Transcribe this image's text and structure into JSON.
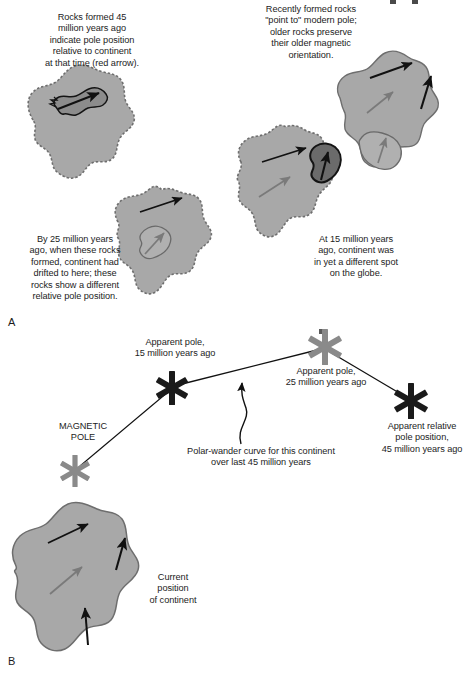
{
  "figure": {
    "background_color": "#ffffff",
    "continent_fill": "#a8a8a8",
    "continent_stroke": "#6e6e6e",
    "dark_rock_fill": "#6b6b6b",
    "dark_rock_stroke": "#141414",
    "light_rock_fill": "#b0b0b0",
    "light_rock_stroke": "#6a6a6a",
    "black_arrow_color": "#111111",
    "gray_arrow_color": "#7a7a7a",
    "star_black": "#1a1a1a",
    "star_gray": "#8a8a8a",
    "line_color": "#111111"
  },
  "panel_a": {
    "letter": "A",
    "captions": [
      {
        "name": "caption-45ma",
        "text": "Rocks formed 45\nmillion years ago\nindicate pole position\nrelative to continent\nat that time (red arrow).",
        "x": 12,
        "y": 12,
        "width": 160
      },
      {
        "name": "caption-recent-rocks",
        "text": "Recently formed rocks\n\"point to\" modern pole;\nolder rocks preserve\ntheir older magnetic\norientation.",
        "x": 236,
        "y": 4,
        "width": 150
      },
      {
        "name": "caption-25ma",
        "text": "By 25 million years\nago, when these rocks\nformed, continent had\ndrifted to here; these\nrocks show a different\nrelative pole position.",
        "x": 8,
        "y": 234,
        "width": 134
      },
      {
        "name": "caption-15ma",
        "text": "At 15 million years\nago, continent was\nin yet a different spot\non the globe.",
        "x": 296,
        "y": 234,
        "width": 120
      }
    ],
    "continents": [
      {
        "name": "continent-45ma",
        "label": "Continent at 45 million years ago",
        "edge": "dashed",
        "rock_type": "dark-outlined",
        "arrows": [
          "black-up-right"
        ]
      },
      {
        "name": "continent-25ma",
        "label": "Continent at 25 million years ago",
        "edge": "dashed",
        "rock_type": "light-outlined",
        "arrows": [
          "black-up-right",
          "gray-up"
        ]
      },
      {
        "name": "continent-15ma",
        "label": "Continent at 15 million years ago",
        "edge": "dashed",
        "rock_type": "dark-filled",
        "arrows": [
          "black-up-right",
          "gray-up-right",
          "black-up"
        ]
      },
      {
        "name": "continent-present",
        "label": "Continent at present day",
        "edge": "solid",
        "rock_type": "light-outlined",
        "arrows": [
          "black-up-right",
          "black-up",
          "gray-up-right",
          "gray-up"
        ]
      }
    ]
  },
  "panel_b": {
    "letter": "B",
    "labels": [
      {
        "name": "label-apparent-pole-15ma",
        "text": "Apparent pole,\n15 million years ago",
        "x": 110,
        "y": 337,
        "width": 130
      },
      {
        "name": "label-apparent-pole-25ma",
        "text": "Apparent pole,\n25 million years ago",
        "x": 262,
        "y": 366,
        "width": 128
      },
      {
        "name": "label-apparent-pole-45ma",
        "text": "Apparent relative\npole position,\n45 million years ago",
        "x": 372,
        "y": 421,
        "width": 100
      },
      {
        "name": "label-magnetic-pole",
        "text": "MAGNETIC\nPOLE",
        "x": 40,
        "y": 421,
        "width": 86
      },
      {
        "name": "label-polar-wander-curve",
        "text": "Polar-wander curve for this continent\nover last 45 million years",
        "x": 168,
        "y": 446,
        "width": 186
      },
      {
        "name": "label-current-position",
        "text": "Current\nposition\nof continent",
        "x": 134,
        "y": 572,
        "width": 78
      }
    ],
    "poles": [
      {
        "name": "star-magnetic-pole",
        "color": "#8a8a8a",
        "x": 75,
        "y": 471,
        "size": 17
      },
      {
        "name": "star-pole-15ma",
        "color": "#1a1a1a",
        "x": 172,
        "y": 388,
        "size": 18
      },
      {
        "name": "star-pole-25ma",
        "color": "#8a8a8a",
        "x": 325,
        "y": 347,
        "size": 19
      },
      {
        "name": "star-pole-45ma",
        "color": "#1a1a1a",
        "x": 411,
        "y": 401,
        "size": 19
      }
    ],
    "curve_segments": [
      {
        "from": "star-pole-45ma",
        "to": "star-pole-25ma"
      },
      {
        "from": "star-pole-25ma",
        "to": "star-pole-15ma"
      },
      {
        "from": "star-pole-15ma",
        "to": "star-magnetic-pole"
      }
    ],
    "continent": {
      "name": "continent-current",
      "label": "Current position of continent",
      "edge": "solid",
      "arrows": [
        "black-up-right",
        "black-up",
        "gray-up-right",
        "black-up-vertical"
      ]
    }
  }
}
